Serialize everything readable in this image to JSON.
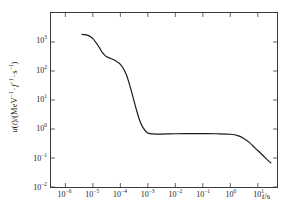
{
  "chart_data": {
    "type": "line",
    "title": "",
    "subtitle": "",
    "xlabel": "t/s",
    "ylabel": "u(t)/(MeV⁻¹ · f⁻¹ · s⁻¹)",
    "xscale": "log",
    "yscale": "log",
    "xlim": [
      3e-07,
      50.0
    ],
    "ylim": [
      0.01,
      10000.0
    ],
    "grid": false,
    "legend": null,
    "legend_position": "none",
    "line_color": "#1a1a1a",
    "line_width": 1.2,
    "x_tick_labels": [
      {
        "exp": "-6",
        "base": "10",
        "value": 1e-06
      },
      {
        "exp": "-5",
        "base": "10",
        "value": 1e-05
      },
      {
        "exp": "-4",
        "base": "10",
        "value": 0.0001
      },
      {
        "exp": "-3",
        "base": "10",
        "value": 0.001
      },
      {
        "exp": "-2",
        "base": "10",
        "value": 0.01
      },
      {
        "exp": "-1",
        "base": "10",
        "value": 0.1
      },
      {
        "exp": "0",
        "base": "10",
        "value": 1
      },
      {
        "exp": "1",
        "base": "10",
        "value": 10
      }
    ],
    "y_tick_labels": [
      {
        "exp": "3",
        "base": "10",
        "value": 1000
      },
      {
        "exp": "2",
        "base": "10",
        "value": 100
      },
      {
        "exp": "1",
        "base": "10",
        "value": 10
      },
      {
        "exp": "0",
        "base": "10",
        "value": 1
      },
      {
        "exp": "-1",
        "base": "10",
        "value": 0.1
      },
      {
        "exp": "-2",
        "base": "10",
        "value": 0.01
      }
    ],
    "series": [
      {
        "name": "u(t)",
        "x": [
          4e-06,
          5e-06,
          6.5e-06,
          8e-06,
          1e-05,
          1.3e-05,
          1.7e-05,
          2.2e-05,
          2.8e-05,
          3.5e-05,
          4.5e-05,
          6e-05,
          8e-05,
          0.0001,
          0.00013,
          0.00017,
          0.00022,
          0.0003,
          0.0004,
          0.00055,
          0.0007,
          0.00085,
          0.001,
          0.0012,
          0.0015,
          0.002,
          0.003,
          0.005,
          0.01,
          0.03,
          0.1,
          0.3,
          1.0,
          2.0,
          3.0,
          5.0,
          8.0,
          12.0,
          18.0,
          25.0,
          30.0
        ],
        "y": [
          1850.0,
          1800.0,
          1700.0,
          1550.0,
          1300.0,
          950.0,
          650.0,
          440.0,
          340.0,
          300.0,
          270.0,
          240.0,
          200.0,
          170.0,
          120.0,
          70.0,
          32.0,
          11.0,
          4.0,
          1.6,
          1.05,
          0.82,
          0.73,
          0.69,
          0.675,
          0.67,
          0.67,
          0.675,
          0.685,
          0.69,
          0.69,
          0.685,
          0.66,
          0.58,
          0.48,
          0.34,
          0.22,
          0.155,
          0.105,
          0.078,
          0.068
        ]
      }
    ],
    "annotations": []
  },
  "axis": {
    "x_title_var": "t",
    "x_title_unit": "/s",
    "y_title_prefix": "u",
    "y_title_var": "t",
    "y_title_mid": ")/(MeV",
    "y_title_exp1": "−1",
    "y_title_f": "f",
    "y_title_exp2": "−1",
    "y_title_s": "s",
    "y_title_exp3": "−1",
    "y_title_close": ")",
    "dot": "·"
  }
}
